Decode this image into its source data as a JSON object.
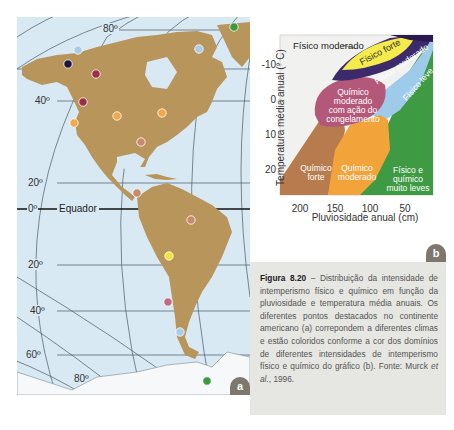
{
  "map": {
    "panel_label": "a",
    "latitude_labels": [
      {
        "text": "80º",
        "hemisphere": "north"
      },
      {
        "text": "40º",
        "hemisphere": "north"
      },
      {
        "text": "20º",
        "hemisphere": "north"
      },
      {
        "text": "0º",
        "hemisphere": "equator"
      },
      {
        "text": "20º",
        "hemisphere": "south"
      },
      {
        "text": "40º",
        "hemisphere": "south"
      },
      {
        "text": "60º",
        "hemisphere": "south"
      },
      {
        "text": "80º",
        "hemisphere": "south"
      }
    ],
    "equator_label": "Equador",
    "points": [
      {
        "color": "#a9cde8",
        "domain": "Físico leve",
        "x": 78,
        "y": 50
      },
      {
        "color": "#a9cde8",
        "domain": "Físico leve",
        "x": 199,
        "y": 49
      },
      {
        "color": "#1b1440",
        "domain": "Físico moderado",
        "x": 68,
        "y": 64
      },
      {
        "color": "#9a3048",
        "domain": "Químico moderado com ação do congelamento",
        "x": 96,
        "y": 74
      },
      {
        "color": "#9a3048",
        "domain": "Químico moderado com ação do congelamento",
        "x": 83,
        "y": 102
      },
      {
        "color": "#f2a84a",
        "domain": "Químico moderado",
        "x": 74,
        "y": 123
      },
      {
        "color": "#f2a84a",
        "domain": "Químico moderado",
        "x": 117,
        "y": 116
      },
      {
        "color": "#f2a84a",
        "domain": "Químico moderado",
        "x": 162,
        "y": 113
      },
      {
        "color": "#3a9a3c",
        "domain": "Físico e químico muito leves",
        "x": 234,
        "y": 27
      },
      {
        "color": "#c98a6e",
        "domain": "Químico forte",
        "x": 141,
        "y": 142
      },
      {
        "color": "#c98a6e",
        "domain": "Químico forte",
        "x": 137,
        "y": 193
      },
      {
        "color": "#c98a6e",
        "domain": "Químico forte",
        "x": 191,
        "y": 220
      },
      {
        "color": "#f3e33a",
        "domain": "Físico forte",
        "x": 169,
        "y": 256
      },
      {
        "color": "#c46a88",
        "domain": "Químico moderado com ação do congelamento",
        "x": 168,
        "y": 302
      },
      {
        "color": "#a9cde8",
        "domain": "Físico leve",
        "x": 180,
        "y": 332
      },
      {
        "color": "#3a9a3c",
        "domain": "Físico e químico muito leves",
        "x": 207,
        "y": 381
      }
    ]
  },
  "chart_data": {
    "type": "area",
    "panel_label": "b",
    "title": "",
    "xlabel": "Pluviosidade anual (cm)",
    "ylabel": "Temperatura média anual (° C)",
    "x_ticks": [
      "200",
      "150",
      "100",
      "50"
    ],
    "y_ticks": [
      "-10",
      "0",
      "10",
      "20"
    ],
    "x_direction": "decreasing",
    "y_direction": "inverted (negative at top)",
    "xlim": [
      230,
      0
    ],
    "ylim": [
      -18,
      28
    ],
    "regions": [
      {
        "name": "Físico moderado",
        "color": "#3d2a6b",
        "position": "top band (coldest, callout label outside)"
      },
      {
        "name": "Físico forte",
        "color": "#f5eb4a",
        "position": "top, ~-15 to -8 °C"
      },
      {
        "name": "Físico moderado",
        "color": "#3d2a6b",
        "position": "band below Físico forte"
      },
      {
        "name": "Físico leve",
        "color": "#9fcbea",
        "position": "right upper, ~-10 to 5 °C, 0-60 cm"
      },
      {
        "name": "Químico moderado com ação do congelamento",
        "color": "#b4587a",
        "position": "middle, ~-3 to 10 °C, 80-170 cm"
      },
      {
        "name": "Químico forte",
        "color": "#b87b4e",
        "position": "lower left, 10-28 °C, >150 cm"
      },
      {
        "name": "Químico moderado",
        "color": "#f2a43a",
        "position": "lower middle, 8-28 °C, 90-160 cm"
      },
      {
        "name": "Físico e químico muito leves",
        "color": "#3e9a43",
        "position": "right, dry, 0-90 cm"
      }
    ],
    "labels": {
      "fisico_moderado_top": "Físico moderado",
      "fisico_forte": "Físico forte",
      "fisico_moderado_band": "Físico moderado",
      "fisico_leve": "Físico leve",
      "quimico_congelamento_1": "Químico",
      "quimico_congelamento_2": "moderado",
      "quimico_congelamento_3": "com ação do",
      "quimico_congelamento_4": "congelamento",
      "quimico_forte_1": "Químico",
      "quimico_forte_2": "forte",
      "quimico_moderado_1": "Químico",
      "quimico_moderado_2": "moderado",
      "muito_leves_1": "Físico e",
      "muito_leves_2": "químico",
      "muito_leves_3": "muito leves"
    }
  },
  "caption": {
    "figure_number": "Figura 8.20",
    "text": " – Distribuição da intensidade de intemperismo físico e químico em função da pluviosidade e temperatura média anuais. Os diferentes pontos destacados no continente americano (a) correpondem a diferentes climas e estão coloridos conforme a cor dos domínios de diferentes intensidades de intemperismo físico e químico do gráfico (b). Fonte: Murck ",
    "et_al": "et al.",
    "year": ", 1996."
  }
}
